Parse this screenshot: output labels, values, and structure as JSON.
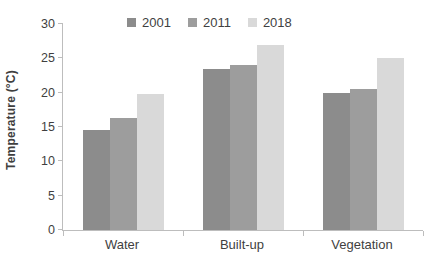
{
  "chart_data": {
    "type": "bar",
    "title": "",
    "ylabel": "Temperature (°C)",
    "xlabel": "",
    "ylim": [
      0,
      30
    ],
    "yticks": [
      0,
      5,
      10,
      15,
      20,
      25,
      30
    ],
    "grid": false,
    "legend_position": "top",
    "categories": [
      "Water",
      "Built-up",
      "Vegetation"
    ],
    "series": [
      {
        "name": "2001",
        "color": "#8c8c8c",
        "values": [
          14.5,
          23.4,
          19.9
        ]
      },
      {
        "name": "2011",
        "color": "#9d9d9d",
        "values": [
          16.3,
          24.1,
          20.5
        ]
      },
      {
        "name": "2018",
        "color": "#d9d9d9",
        "values": [
          19.8,
          27.0,
          25.0
        ]
      }
    ]
  },
  "colors": {
    "axis_line": "#bdbdbd",
    "text": "#3f3f3f",
    "background": "#ffffff"
  }
}
